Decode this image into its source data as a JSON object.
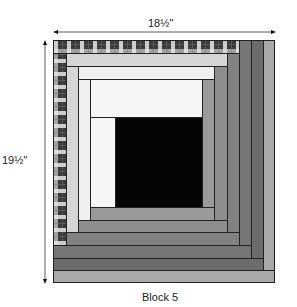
{
  "diagram": {
    "type": "log-cabin quilt block",
    "caption": "Block 5",
    "width_label": "18½\"",
    "height_label": "19½\"",
    "colors": {
      "black": "#050505",
      "white": "#f6f6f6",
      "white_ring2": "#f0f0f0",
      "light_gray": "#d6d6d6",
      "gray_ring1": "#9a9a9a",
      "gray_ring2": "#8e8e8e",
      "gray_ring3": "#828282",
      "gray_ring4": "#767676",
      "dark_ring5": "#6c6c6c",
      "light_ring6": "#a9a9a9",
      "plaid_base": "#3a3a3a",
      "outline": "#222222"
    },
    "pieces": [
      {
        "id": "center",
        "fabric": "black",
        "x": 115,
        "y": 117,
        "w": 87,
        "h": 90
      },
      {
        "id": "r0-left",
        "fabric": "white",
        "x": 90,
        "y": 117,
        "w": 25,
        "h": 90
      },
      {
        "id": "r0-top",
        "fabric": "white",
        "x": 90,
        "y": 79,
        "w": 112,
        "h": 38
      },
      {
        "id": "r1-right",
        "fabric": "gray_ring1",
        "x": 202,
        "y": 79,
        "w": 12,
        "h": 128
      },
      {
        "id": "r1-bottom",
        "fabric": "gray_ring1",
        "x": 90,
        "y": 207,
        "w": 124,
        "h": 13
      },
      {
        "id": "r2-left",
        "fabric": "white_ring2",
        "x": 78,
        "y": 66,
        "w": 12,
        "h": 154
      },
      {
        "id": "r2-top",
        "fabric": "white_ring2",
        "x": 78,
        "y": 66,
        "w": 136,
        "h": 13
      },
      {
        "id": "r2-right",
        "fabric": "gray_ring2",
        "x": 214,
        "y": 66,
        "w": 13,
        "h": 154
      },
      {
        "id": "r2-bottom",
        "fabric": "gray_ring2",
        "x": 78,
        "y": 220,
        "w": 149,
        "h": 12
      },
      {
        "id": "r3-left",
        "fabric": "light_gray",
        "x": 66,
        "y": 53,
        "w": 12,
        "h": 179
      },
      {
        "id": "r3-top",
        "fabric": "light_gray",
        "x": 66,
        "y": 53,
        "w": 161,
        "h": 13
      },
      {
        "id": "r3-right",
        "fabric": "gray_ring3",
        "x": 227,
        "y": 53,
        "w": 12,
        "h": 179
      },
      {
        "id": "r3-bottom",
        "fabric": "gray_ring3",
        "x": 66,
        "y": 232,
        "w": 173,
        "h": 13
      },
      {
        "id": "r4-left",
        "fabric": "plaid",
        "x": 53,
        "y": 40,
        "w": 13,
        "h": 205
      },
      {
        "id": "r4-top",
        "fabric": "plaid",
        "x": 53,
        "y": 40,
        "w": 186,
        "h": 13
      },
      {
        "id": "r4-right",
        "fabric": "gray_ring4",
        "x": 239,
        "y": 40,
        "w": 12,
        "h": 205
      },
      {
        "id": "r4-bottom",
        "fabric": "gray_ring4",
        "x": 53,
        "y": 245,
        "w": 198,
        "h": 13
      },
      {
        "id": "r5-right",
        "fabric": "dark_ring5",
        "x": 251,
        "y": 40,
        "w": 12,
        "h": 218
      },
      {
        "id": "r5-bottom",
        "fabric": "dark_ring5",
        "x": 53,
        "y": 258,
        "w": 210,
        "h": 12
      },
      {
        "id": "r6-right",
        "fabric": "light_ring6",
        "x": 263,
        "y": 40,
        "w": 12,
        "h": 230
      },
      {
        "id": "r6-bottom",
        "fabric": "light_ring6",
        "x": 53,
        "y": 270,
        "w": 222,
        "h": 13
      }
    ]
  }
}
